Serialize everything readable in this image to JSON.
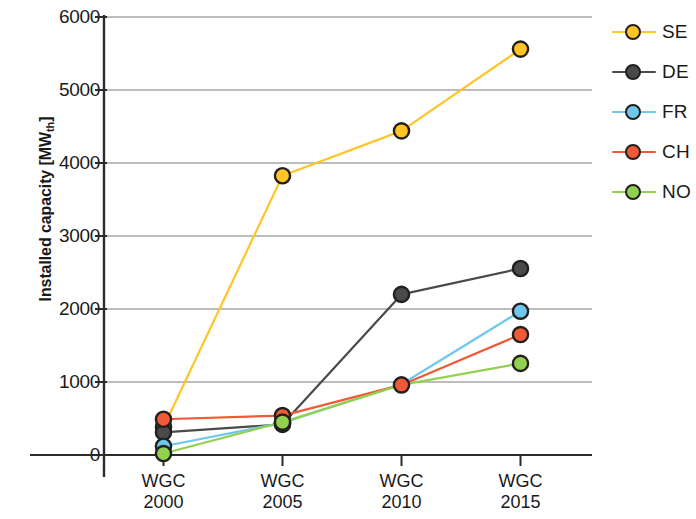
{
  "chart_data": {
    "type": "line",
    "title": "",
    "xlabel": "",
    "ylabel": "Installed capacity [MWth]",
    "ylabel_base": "Installed capacity [MW",
    "ylabel_sub": "th",
    "ylabel_close": "]",
    "categories": [
      "WGC 2000",
      "WGC 2005",
      "WGC 2010",
      "WGC 2015"
    ],
    "category_lines": [
      [
        "WGC",
        "2000"
      ],
      [
        "WGC",
        "2005"
      ],
      [
        "WGC",
        "2010"
      ],
      [
        "WGC",
        "2015"
      ]
    ],
    "ylim": [
      0,
      6000
    ],
    "yticks": [
      0,
      1000,
      2000,
      3000,
      4000,
      5000,
      6000
    ],
    "ytick_labels": [
      "0",
      "1000",
      "2000",
      "3000",
      "4000",
      "5000",
      "6000"
    ],
    "grid": true,
    "legend_position": "right",
    "series": [
      {
        "name": "SE",
        "color": "#FFC425",
        "values": [
          380,
          3825,
          4440,
          5560
        ]
      },
      {
        "name": "DE",
        "color": "#4A4A4A",
        "values": [
          310,
          420,
          2200,
          2555
        ]
      },
      {
        "name": "FR",
        "color": "#6FC8EC",
        "values": [
          120,
          440,
          970,
          1970
        ]
      },
      {
        "name": "CH",
        "color": "#F05A36",
        "values": [
          490,
          540,
          960,
          1650
        ]
      },
      {
        "name": "NO",
        "color": "#92D050",
        "values": [
          20,
          450,
          960,
          1255
        ]
      }
    ]
  },
  "legend": {
    "items": [
      {
        "label": "SE",
        "color": "#FFC425"
      },
      {
        "label": "DE",
        "color": "#4A4A4A"
      },
      {
        "label": "FR",
        "color": "#6FC8EC"
      },
      {
        "label": "CH",
        "color": "#F05A36"
      },
      {
        "label": "NO",
        "color": "#92D050"
      }
    ]
  },
  "axes": {
    "y_title": "Installed capacity [MWth]"
  }
}
